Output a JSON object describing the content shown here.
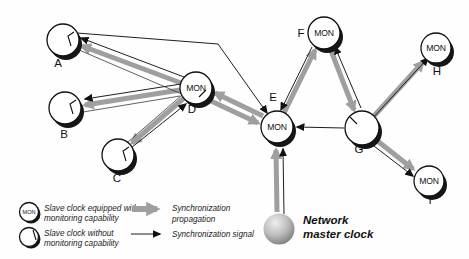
{
  "figure": {
    "type": "synchronization-network-diagram",
    "mon_badge": "MON",
    "nodes": [
      {
        "id": "A",
        "label": "A",
        "monitoring": false
      },
      {
        "id": "B",
        "label": "B",
        "monitoring": false
      },
      {
        "id": "C",
        "label": "C",
        "monitoring": false
      },
      {
        "id": "D",
        "label": "D",
        "monitoring": true
      },
      {
        "id": "E",
        "label": "E",
        "monitoring": true
      },
      {
        "id": "F",
        "label": "F",
        "monitoring": true
      },
      {
        "id": "G",
        "label": "G",
        "monitoring": false
      },
      {
        "id": "H",
        "label": "H",
        "monitoring": true
      },
      {
        "id": "I",
        "label": "I",
        "monitoring": true
      }
    ],
    "master": {
      "label_line1": "Network",
      "label_line2": "master clock"
    },
    "edges": [
      {
        "from": "master",
        "to": "E",
        "propagation": true,
        "signal": true
      },
      {
        "from": "E",
        "to": "D",
        "propagation": true,
        "signal": false
      },
      {
        "from": "D",
        "to": "E",
        "propagation": true,
        "signal": false
      },
      {
        "from": "D",
        "to": "A",
        "propagation": true,
        "signal": true
      },
      {
        "from": "D",
        "to": "B",
        "propagation": true,
        "signal": true
      },
      {
        "from": "D",
        "to": "C",
        "propagation": true,
        "signal": false
      },
      {
        "from": "C",
        "to": "D",
        "propagation": false,
        "signal": true
      },
      {
        "from": "A",
        "to": "E",
        "propagation": false,
        "signal": true
      },
      {
        "from": "E",
        "to": "F",
        "propagation": true,
        "signal": false
      },
      {
        "from": "F",
        "to": "E",
        "propagation": false,
        "signal": true
      },
      {
        "from": "F",
        "to": "G",
        "propagation": true,
        "signal": false
      },
      {
        "from": "G",
        "to": "F",
        "propagation": false,
        "signal": true
      },
      {
        "from": "G",
        "to": "E",
        "propagation": false,
        "signal": true
      },
      {
        "from": "G",
        "to": "H",
        "propagation": true,
        "signal": true
      },
      {
        "from": "G",
        "to": "I",
        "propagation": true,
        "signal": true
      }
    ],
    "legend": {
      "mon_clock_line1": "Slave clock equipped with",
      "mon_clock_line2": "monitoring capability",
      "plain_clock_line1": "Slave clock without",
      "plain_clock_line2": "monitoring capability",
      "propagation_line1": "Synchronization",
      "propagation_line2": "propagation",
      "signal_label": "Synchronization signal"
    },
    "colors": {
      "propagation_arrow": "#9f9f9f",
      "signal_arrow": "#1f1f1f",
      "clock_fill": "#ffffff",
      "clock_shadow": "#161616"
    }
  }
}
